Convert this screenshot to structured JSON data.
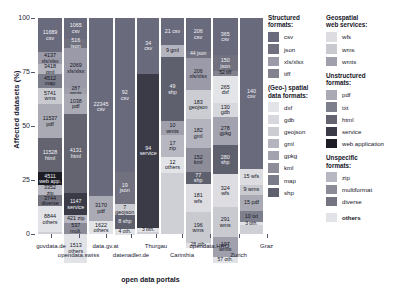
{
  "chart_data": {
    "type": "bar",
    "stacked": true,
    "title": "",
    "xlabel": "open data portals",
    "ylabel": "Affected datasets (%)",
    "ylim": [
      0,
      100
    ],
    "yticks": [
      "0",
      "25",
      "50",
      "75",
      "100"
    ],
    "grid": false,
    "legend_position": "right",
    "categories": [
      "govdata.de",
      "opendata.swiss",
      "data.gv.at",
      "datenadler.de",
      "Thurgau",
      "Carinthia",
      "opendata.HRO",
      "Zurich",
      "Graz"
    ],
    "series": [
      {
        "name": "govdata.de",
        "segments": [
          {
            "format": "csv",
            "value": 11689,
            "label": "11689\ncsv",
            "pct": 15.9
          },
          {
            "format": "xls/xlsx",
            "value": 4137,
            "label": "4137\nxls/xlsx",
            "pct": 5.6
          },
          {
            "format": "gml",
            "value": 3418,
            "label": "3418\ngml",
            "pct": 4.6
          },
          {
            "format": "map",
            "value": 4512,
            "label": "4512\nmap",
            "pct": 6.1
          },
          {
            "format": "wms",
            "value": 5741,
            "label": "5741\nwms",
            "pct": 7.8
          },
          {
            "format": "pdf",
            "value": 11537,
            "label": "11537\npdf",
            "pct": 15.7
          },
          {
            "format": "html",
            "value": 11528,
            "label": "11528\nhtml",
            "pct": 15.7
          },
          {
            "format": "web application",
            "value": 4511,
            "label": "4511\nweb app.",
            "pct": 6.1
          },
          {
            "format": "zip",
            "value": 3352,
            "label": "3352\nzip",
            "pct": 4.6
          },
          {
            "format": "diverse",
            "value": 3744,
            "label": "3744\ndiverse",
            "pct": 5.1
          },
          {
            "format": "others",
            "value": 8844,
            "label": "8844\nothers",
            "pct": 12.0
          }
        ]
      },
      {
        "name": "opendata.swiss",
        "segments": [
          {
            "format": "csv",
            "value": 1065,
            "label": "1065\ncsv",
            "pct": 9.5
          },
          {
            "format": "json",
            "value": 516,
            "label": "516\njson",
            "pct": 4.6
          },
          {
            "format": "xls/xlsx",
            "value": 2069,
            "label": "2069\nxls/xlsx",
            "pct": 18.4
          },
          {
            "format": "wmts",
            "value": 287,
            "label": "287\nwmts",
            "pct": 2.6
          },
          {
            "format": "pdf",
            "value": 1038,
            "label": "1038\npdf",
            "pct": 9.2
          },
          {
            "format": "html",
            "value": 4131,
            "label": "4131\nhtml",
            "pct": 36.8
          },
          {
            "format": "service",
            "value": 1147,
            "label": "1147\nservice",
            "pct": 10.2
          },
          {
            "format": "zip",
            "value": 421,
            "label": "421 zip",
            "pct": 3.7
          },
          {
            "format": "multiformat",
            "value": 537,
            "label": "537\nmult.",
            "pct": 4.8
          },
          {
            "format": "others",
            "value": 1513,
            "label": "1513\nothers",
            "pct": 13.5
          }
        ]
      },
      {
        "name": "data.gv.at",
        "segments": [
          {
            "format": "csv",
            "value": 22345,
            "label": "22345\ncsv",
            "pct": 82.3
          },
          {
            "format": "pdf",
            "value": 3170,
            "label": "3170\npdf",
            "pct": 11.7
          },
          {
            "format": "others",
            "value": 1622,
            "label": "1622\nothers",
            "pct": 6.0
          }
        ]
      },
      {
        "name": "datenadler.de",
        "segments": [
          {
            "format": "csv",
            "value": 92,
            "label": "92\ncsv",
            "pct": 71.3
          },
          {
            "format": "json",
            "value": 19,
            "label": "19\njson",
            "pct": 14.7
          },
          {
            "format": "geojson",
            "value": 7,
            "label": "7\ngeojson",
            "pct": 5.4
          },
          {
            "format": "shp",
            "value": 8,
            "label": "8 shp",
            "pct": 6.2
          },
          {
            "format": "others",
            "value": 4,
            "label": "4 oth.",
            "pct": 3.1
          }
        ]
      },
      {
        "name": "Thurgau",
        "segments": [
          {
            "format": "csv",
            "value": 34,
            "label": "34\ncsv",
            "pct": 25.8
          },
          {
            "format": "service",
            "value": 94,
            "label": "94\nservice",
            "pct": 71.2
          },
          {
            "format": "others",
            "value": 3,
            "label": "3 oth.",
            "pct": 2.3
          }
        ]
      },
      {
        "name": "Carinthia",
        "segments": [
          {
            "format": "csv",
            "value": 21,
            "label": "21 csv",
            "pct": 12.7
          },
          {
            "format": "gml",
            "value": 9,
            "label": "9 gml",
            "pct": 5.5
          },
          {
            "format": "shp",
            "value": 49,
            "label": "49\nshp",
            "pct": 29.7
          },
          {
            "format": "wmts",
            "value": 10,
            "label": "10\nwmts",
            "pct": 6.1
          },
          {
            "format": "zip",
            "value": 17,
            "label": "17\nzip",
            "pct": 10.3
          },
          {
            "format": "others",
            "value": 12,
            "label": "12\nothers",
            "pct": 7.3
          }
        ]
      },
      {
        "name": "opendata.HRO",
        "segments": [
          {
            "format": "csv",
            "value": 206,
            "label": "206\ncsv",
            "pct": 15.1
          },
          {
            "format": "json",
            "value": 44,
            "label": "44 json",
            "pct": 3.2
          },
          {
            "format": "xls/xlsx",
            "value": 206,
            "label": "206\nxls/xlsx",
            "pct": 15.1
          },
          {
            "format": "geojson",
            "value": 183,
            "label": "183\ngeojson",
            "pct": 13.4
          },
          {
            "format": "gml",
            "value": 182,
            "label": "182\ngml",
            "pct": 13.3
          },
          {
            "format": "kml",
            "value": 152,
            "label": "152\nkml",
            "pct": 11.1
          },
          {
            "format": "shp",
            "value": 77,
            "label": "77\nshp",
            "pct": 5.6
          },
          {
            "format": "wfs",
            "value": 181,
            "label": "181\nwfs",
            "pct": 13.2
          },
          {
            "format": "wms",
            "value": 196,
            "label": "196\nwms",
            "pct": 14.3
          },
          {
            "format": "others",
            "value": 28,
            "label": "28 oth.",
            "pct": 2.0
          }
        ]
      },
      {
        "name": "Zurich",
        "segments": [
          {
            "format": "csv",
            "value": 365,
            "label": "365\ncsv",
            "pct": 17.3
          },
          {
            "format": "json",
            "value": 150,
            "label": "150\njson",
            "pct": 7.1
          },
          {
            "format": "tiff",
            "value": 52,
            "label": "52 tiff",
            "pct": 2.5
          },
          {
            "format": "dxf",
            "value": 265,
            "label": "265\ndxf",
            "pct": 12.6
          },
          {
            "format": "gdb",
            "value": 130,
            "label": "130\ngdb",
            "pct": 6.2
          },
          {
            "format": "gpkg",
            "value": 278,
            "label": "278\ngpkg",
            "pct": 13.2
          },
          {
            "format": "shp",
            "value": 280,
            "label": "280\nshp",
            "pct": 13.3
          },
          {
            "format": "wfs",
            "value": 324,
            "label": "324\nwfs",
            "pct": 15.4
          },
          {
            "format": "wms",
            "value": 291,
            "label": "291\nwms",
            "pct": 13.8
          },
          {
            "format": "wmts",
            "value": 197,
            "label": "197\nwmts",
            "pct": 9.3
          },
          {
            "format": "others",
            "value": 57,
            "label": "57 oth.",
            "pct": 2.7
          }
        ]
      },
      {
        "name": "Graz",
        "segments": [
          {
            "format": "csv",
            "value": 140,
            "label": "140\ncsv",
            "pct": 70.0
          },
          {
            "format": "wfs",
            "value": 15,
            "label": "15 wfs",
            "pct": 7.5
          },
          {
            "format": "wms",
            "value": 9,
            "label": "9 wms",
            "pct": 4.5
          },
          {
            "format": "pdf",
            "value": 15,
            "label": "15 pdf",
            "pct": 7.5
          },
          {
            "format": "txt",
            "value": 10,
            "label": "10 txt",
            "pct": 5.0
          },
          {
            "format": "others",
            "value": 3,
            "label": "3 oth.",
            "pct": 1.5
          }
        ]
      }
    ]
  },
  "legend": {
    "groups": [
      {
        "column": "a",
        "title": "Structured\nformats:",
        "items": [
          {
            "label": "csv",
            "color": "#6a6a7d"
          },
          {
            "label": "json",
            "color": "#70707f"
          },
          {
            "label": "xls/xlsx",
            "color": "#9a9aa8"
          },
          {
            "label": "tiff",
            "color": "#82828f"
          }
        ]
      },
      {
        "column": "a",
        "title": "(Geo-) spatial\ndata formats:",
        "items": [
          {
            "label": "dxf",
            "color": "#e3e4e8"
          },
          {
            "label": "gdb",
            "color": "#d7d8dd"
          },
          {
            "label": "geojson",
            "color": "#cccdd3"
          },
          {
            "label": "gml",
            "color": "#b3b4be"
          },
          {
            "label": "gpkg",
            "color": "#a2a3ae"
          },
          {
            "label": "kml",
            "color": "#8c8d99"
          },
          {
            "label": "map",
            "color": "#7b7c89"
          },
          {
            "label": "shp",
            "color": "#5f606e"
          }
        ]
      },
      {
        "column": "b",
        "title": "Geospatial\nweb services:",
        "items": [
          {
            "label": "wfs",
            "color": "#dcdce1"
          },
          {
            "label": "wms",
            "color": "#c9cad0"
          },
          {
            "label": "wmts",
            "color": "#9fa0ab"
          }
        ]
      },
      {
        "column": "b",
        "title": "Unstructured\nformats:",
        "items": [
          {
            "label": "pdf",
            "color": "#a9aab4"
          },
          {
            "label": "txt",
            "color": "#7e7f8c"
          },
          {
            "label": "html",
            "color": "#63646f"
          },
          {
            "label": "service",
            "color": "#3a3b46"
          },
          {
            "label": "web application",
            "color": "#1b1c24"
          }
        ]
      },
      {
        "column": "b",
        "title": "Unspecific\nformats:",
        "items": [
          {
            "label": "zip",
            "color": "#b6b7c0"
          },
          {
            "label": "multiformat",
            "color": "#8b8c97"
          },
          {
            "label": "diverse",
            "color": "#73747f"
          }
        ]
      },
      {
        "column": "b",
        "title": "",
        "items": [
          {
            "label": "others",
            "color": "#e2e3e7",
            "bold": true
          }
        ]
      }
    ]
  }
}
